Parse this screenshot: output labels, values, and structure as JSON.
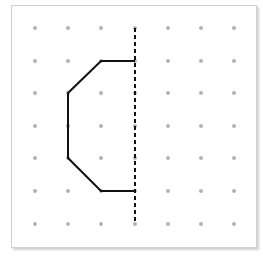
{
  "diagram": {
    "type": "dot-grid-symmetry",
    "grid": {
      "columns": 7,
      "rows": 7,
      "x": [
        35,
        68,
        101,
        135,
        168,
        201,
        234
      ],
      "y": [
        28,
        61,
        93,
        126,
        158,
        191,
        224
      ],
      "dot_color": "#b3b3b3",
      "dot_radius": 2
    },
    "line_of_symmetry": {
      "style": "dashed",
      "color": "#111111",
      "x": 135,
      "y1": 28,
      "y2": 224
    },
    "half_shape": {
      "color": "#111111",
      "stroke_width": 2,
      "grid_points": [
        [
          3,
          1
        ],
        [
          2,
          1
        ],
        [
          1,
          2
        ],
        [
          1,
          4
        ],
        [
          2,
          5
        ],
        [
          3,
          5
        ]
      ],
      "pixel_points": [
        [
          135,
          61
        ],
        [
          101,
          61
        ],
        [
          68,
          93
        ],
        [
          68,
          158
        ],
        [
          101,
          191
        ],
        [
          135,
          191
        ]
      ]
    },
    "frame": {
      "border_color": "#d2d2d2",
      "background": "#ffffff"
    }
  }
}
